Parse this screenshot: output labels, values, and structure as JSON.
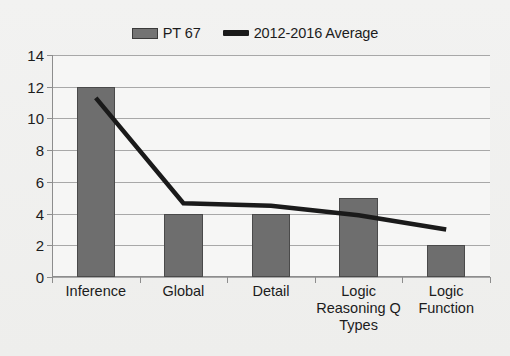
{
  "chart_data": {
    "type": "bar",
    "title": "",
    "subtitle": "",
    "xlabel": "",
    "ylabel": "",
    "categories": [
      "Inference",
      "Global",
      "Detail",
      "Logic Reasoning Q Types",
      "Logic Function"
    ],
    "ylim": [
      0,
      14
    ],
    "yticks": [
      0,
      2,
      4,
      6,
      8,
      10,
      12,
      14
    ],
    "ytick_labels": [
      "0",
      "2",
      "4",
      "6",
      "8",
      "10",
      "12",
      "14"
    ],
    "grid": true,
    "legend_position": "top-center",
    "series": [
      {
        "name": "PT 67",
        "type": "bar",
        "color": "#6e6e6e",
        "values": [
          12,
          4,
          4,
          5,
          2
        ]
      },
      {
        "name": "2012-2016 Average",
        "type": "line",
        "color": "#1a1a1a",
        "values": [
          11.3,
          4.65,
          4.5,
          3.9,
          3.0
        ]
      }
    ]
  },
  "legend": {
    "entries": [
      {
        "label": "PT 67",
        "swatch": "bar-swatch",
        "color": "#6e6e6e"
      },
      {
        "label": "2012-2016 Average",
        "swatch": "line-swatch",
        "color": "#1a1a1a"
      }
    ]
  },
  "axes": {
    "y": {
      "labels": [
        "14",
        "12",
        "10",
        "8",
        "6",
        "4",
        "2",
        "0"
      ]
    },
    "x": {
      "labels": [
        {
          "lines": [
            "Inference"
          ]
        },
        {
          "lines": [
            "Global"
          ]
        },
        {
          "lines": [
            "Detail"
          ]
        },
        {
          "lines": [
            "Logic",
            "Reasoning Q",
            "Types"
          ]
        },
        {
          "lines": [
            "Logic",
            "Function"
          ]
        }
      ]
    }
  }
}
